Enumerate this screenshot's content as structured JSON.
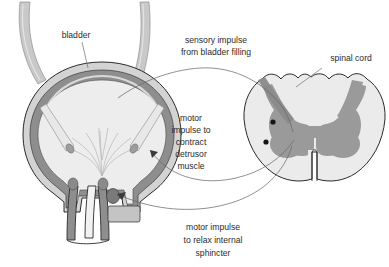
{
  "figure": {
    "background_color": "#ffffff"
  },
  "labels": {
    "bladder": "bladder",
    "sensory": {
      "line1": "sensory impulse",
      "line2": "from bladder filling"
    },
    "spinal_cord": "spinal cord",
    "motor_detrusor": {
      "line1": "motor",
      "line2": "impulse to",
      "line3": "contract",
      "line4": "detrusor",
      "line5": "muscle"
    },
    "motor_sphincter": {
      "line1": "motor impulse",
      "line2": "to relax internal",
      "line3": "sphincter"
    }
  },
  "colors": {
    "text": "#2b2b2b",
    "outline": "#2a2a2a",
    "leader": "#6f6f6f",
    "nerve": "#6b6b6b",
    "bladder_serosa": "#d3d3d3",
    "bladder_detrusor": "#8e8e8e",
    "bladder_lumen": "#ededed",
    "bladder_mucosa": "#f4f4f4",
    "ureter_fill": "#c9c9c9",
    "ureter_inner": "#e6e6e6",
    "cord_white_matter": "#ebebeb",
    "cord_grey_matter": "#9a9a9a",
    "cord_dorsal_band": "#8a8a8a",
    "neuron_dot": "#161616",
    "sphincter_oval": "#7a7a7a",
    "gland_block": "#c4c4c4"
  },
  "structures": {
    "ureter_left": "left ureter",
    "ureter_right": "right ureter",
    "bladder_wall": "bladder wall / detrusor muscle",
    "bladder_lumen": "bladder lumen",
    "rugae": "mucosal folds (rugae)",
    "ureteral_orifice_left": "left ureteral orifice",
    "ureteral_orifice_right": "right ureteral orifice",
    "bladder_neck": "bladder neck",
    "urethra": "urethra",
    "internal_sphincter": "internal sphincter",
    "spinal_cord_section": "spinal cord cross-section",
    "grey_matter": "grey matter (butterfly)",
    "anterior_fissure": "anterior median fissure",
    "sensory_neuron_dot": "sensory neuron cell body",
    "motor_neuron_dot": "motor neuron cell body",
    "arrow_detrusor": "arrowhead at detrusor",
    "arrow_sphincter": "arrowhead at sphincter"
  }
}
